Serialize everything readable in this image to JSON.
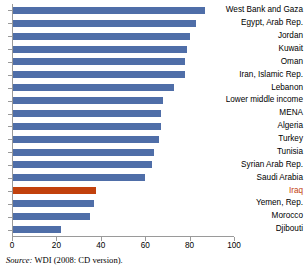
{
  "source_note": {
    "label": "Source:",
    "text": " WDI (2008: CD version)."
  },
  "colors": {
    "bar": "#4F6EA8",
    "highlight": "#C2410C",
    "axis": "#9a9a9a",
    "text": "#000000"
  },
  "chart_data": {
    "type": "bar",
    "orientation": "horizontal",
    "title": "",
    "xlabel": "",
    "ylabel": "",
    "xlim": [
      0,
      100
    ],
    "xticks": [
      0,
      20,
      40,
      60,
      80,
      100
    ],
    "xtick_labels": [
      "0",
      "20",
      "40",
      "60",
      "80",
      "100"
    ],
    "grid": false,
    "legend": "none",
    "highlight_category": "Iraq",
    "categories": [
      "West Bank and Gaza",
      "Egypt, Arab Rep.",
      "Jordan",
      "Kuwait",
      "Oman",
      "Iran, Islamic Rep.",
      "Lebanon",
      "Lower middle income",
      "MENA",
      "Algeria",
      "Turkey",
      "Tunisia",
      "Syrian Arab Rep.",
      "Saudi Arabia",
      "Iraq",
      "Yemen, Rep.",
      "Morocco",
      "Djibouti"
    ],
    "values": [
      87,
      83,
      80,
      79,
      78,
      78,
      73,
      68,
      67,
      67,
      66,
      64,
      63,
      60,
      38,
      37,
      35,
      22
    ]
  }
}
